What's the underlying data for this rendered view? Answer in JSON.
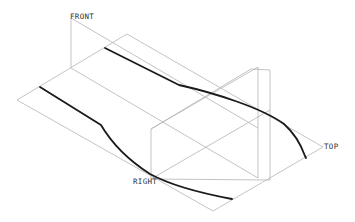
{
  "view": {
    "type": "isometric datum planes with sketched curves",
    "background": "#ffffff",
    "plane_color": "#b4b4b4",
    "curve_color": "#1a1a1a"
  },
  "datum_planes": [
    {
      "name": "FRONT",
      "label": "FRONT"
    },
    {
      "name": "TOP",
      "label": "TOP"
    },
    {
      "name": "RIGHT",
      "label": "RIGHT"
    }
  ],
  "labels": {
    "front": "FRONT",
    "top": "TOP",
    "right": "RIGHT"
  },
  "curves": [
    {
      "name": "upper-curve",
      "description": "straight segment then descending arc"
    },
    {
      "name": "lower-curve",
      "description": "straight segment then descending arc"
    }
  ]
}
